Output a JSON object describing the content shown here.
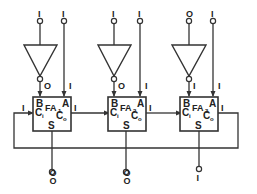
{
  "diagram": {
    "title": "",
    "type": "ripple-carry adder loop with inverters",
    "stages": [
      {
        "name": "FA",
        "index": "1",
        "inputs_top": {
          "inverter_in": "I",
          "a_in": "I"
        },
        "b_value": "O",
        "a_value": "I",
        "ports": {
          "b": "B",
          "a": "A",
          "ci": "C",
          "ci_sub": "i",
          "co": "C",
          "co_sub": "o",
          "s": "S"
        },
        "ci_value": "I",
        "co_value": "I",
        "sum_outputs": [
          "O",
          "O"
        ]
      },
      {
        "name": "FA",
        "index": "2",
        "inputs_top": {
          "inverter_in": "I",
          "a_in": "I"
        },
        "b_value": "O",
        "a_value": "I",
        "ports": {
          "b": "B",
          "a": "A",
          "ci": "C",
          "ci_sub": "i",
          "co": "C",
          "co_sub": "o",
          "s": "S"
        },
        "ci_value": "",
        "co_value": "I",
        "sum_outputs": [
          "O",
          "O"
        ]
      },
      {
        "name": "FA",
        "index": "3",
        "inputs_top": {
          "inverter_in": "O",
          "a_in": "I"
        },
        "b_value": "I",
        "a_value": "I",
        "ports": {
          "b": "B",
          "a": "A",
          "ci": "C",
          "ci_sub": "i",
          "co": "C",
          "co_sub": "o",
          "s": "S"
        },
        "ci_value": "",
        "co_value": "I",
        "sum_outputs": [
          "I"
        ]
      }
    ],
    "colors": {
      "line": "#333333",
      "background": "#ffffff"
    }
  }
}
